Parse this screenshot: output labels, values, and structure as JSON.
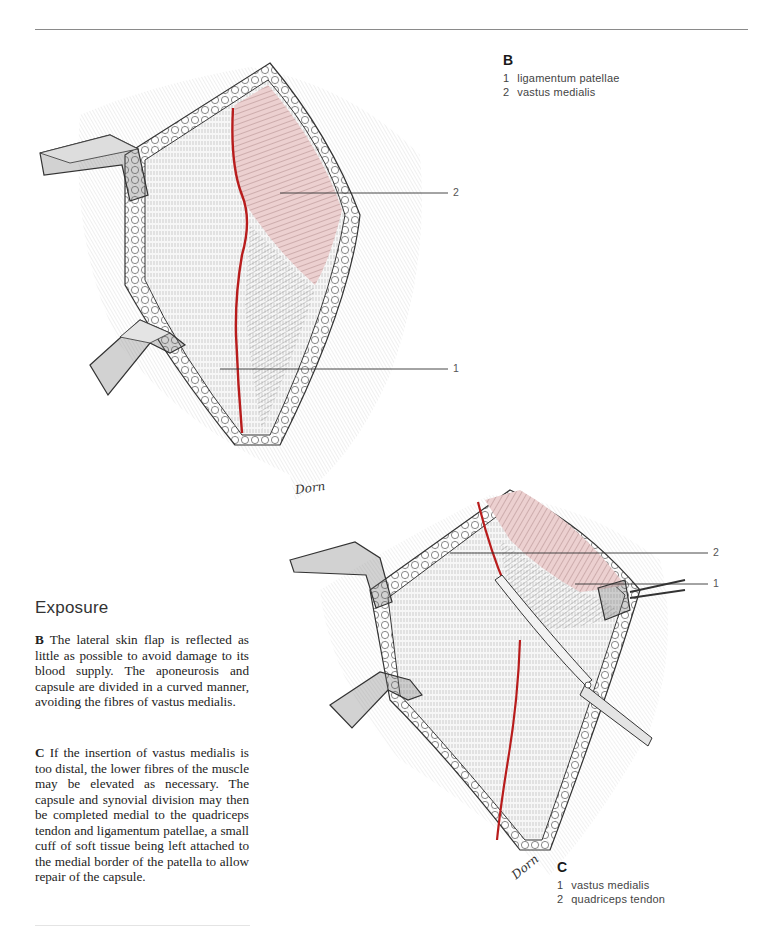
{
  "page": {
    "section_title": "Exposure"
  },
  "paragraphs": [
    {
      "figure_ref": "B",
      "text": "The lateral skin flap is reflected as little as possible to avoid damage to its blood supply. The aponeurosis and capsule are divided in a curved manner, avoiding the fibres of vastus medialis."
    },
    {
      "figure_ref": "C",
      "text": "If the insertion of vastus medialis is too distal, the lower fibres of the muscle may be elevated as necessary. The capsule and synovial division may then be completed medial to the quadriceps tendon and ligamentum patellae, a small cuff of soft tissue being left attached to the medial border of the patella to allow repair of the capsule."
    }
  ],
  "figures": {
    "B": {
      "letter": "B",
      "legend": [
        {
          "num": "1",
          "label": "ligamentum patellae"
        },
        {
          "num": "2",
          "label": "vastus medialis"
        }
      ],
      "callouts": [
        {
          "num": "2"
        },
        {
          "num": "1"
        }
      ],
      "signature": "Dorn"
    },
    "C": {
      "letter": "C",
      "legend": [
        {
          "num": "1",
          "label": "vastus medialis"
        },
        {
          "num": "2",
          "label": "quadriceps tendon"
        }
      ],
      "callouts": [
        {
          "num": "2"
        },
        {
          "num": "1"
        }
      ],
      "signature": "Dorn"
    }
  },
  "colors": {
    "incision_red": "#b81c1c",
    "muscle_pink": "#e8c4c4",
    "rule_gray": "#8a8a8a",
    "ink": "#2a2a2a"
  }
}
